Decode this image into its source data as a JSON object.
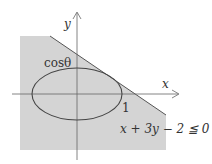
{
  "diagram": {
    "axes": {
      "x_label": "x",
      "y_label": "y"
    },
    "ellipse": {
      "y_intercept_label": "cosθ",
      "x_intercept_label": "1"
    },
    "region": {
      "inequality_label": "x + 3y − 2 ≦ 0",
      "fill_color": "#d4d4d4"
    },
    "colors": {
      "line": "#444444",
      "background": "#ffffff"
    }
  }
}
